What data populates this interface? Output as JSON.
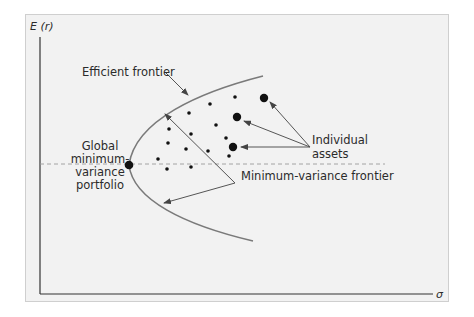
{
  "diagram": {
    "y_axis_label": "E (r)",
    "x_axis_label": "σ",
    "labels": {
      "efficient_frontier": "Efficient frontier",
      "individual_assets_line1": "Individual",
      "individual_assets_line2": "assets",
      "global_min_line1": "Global",
      "global_min_line2": "minimum-",
      "global_min_line3": "variance",
      "global_min_line4": "portfolio",
      "min_variance_frontier": "Minimum-variance frontier"
    },
    "colors": {
      "background": "#f2f2f2",
      "frame_border": "#cfcfcf",
      "curve": "#7a7a7a",
      "arrow": "#555555",
      "dot": "#111111",
      "dashed_line": "#9a9a9a"
    }
  }
}
